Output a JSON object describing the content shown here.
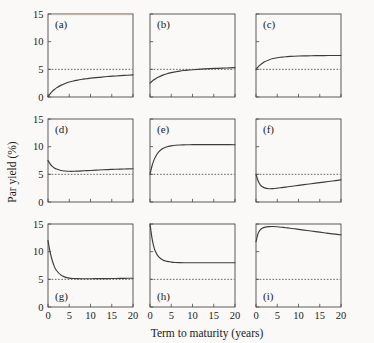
{
  "figure": {
    "background_color": "#faf9f7",
    "line_color": "#3c3c3c",
    "axis_color": "#4a4a4a",
    "x_axis_title": "Term to maturity (years)",
    "y_axis_title": "Par yield (%)",
    "x_ticks": [
      0,
      5,
      10,
      15,
      20
    ],
    "y_ticks": [
      0,
      5,
      10,
      15
    ],
    "x_tick_labels": [
      "0",
      "5",
      "10",
      "15",
      "20"
    ],
    "y_tick_labels": [
      "0",
      "5",
      "10",
      "15"
    ],
    "reference_level": 5,
    "reference_style": "dotted"
  },
  "chart_data": {
    "type": "line",
    "title": "",
    "xlabel": "Term to maturity (years)",
    "ylabel": "Par yield (%)",
    "xlim": [
      0,
      20
    ],
    "ylim": [
      0,
      15
    ],
    "grid": false,
    "legend": "none",
    "layout": "3x3 grid of panels",
    "annotations": [
      {
        "panel": "a",
        "text": "(a)",
        "position": "top-left"
      },
      {
        "panel": "b",
        "text": "(b)",
        "position": "top-left"
      },
      {
        "panel": "c",
        "text": "(c)",
        "position": "top-left"
      },
      {
        "panel": "d",
        "text": "(d)",
        "position": "top-left"
      },
      {
        "panel": "e",
        "text": "(e)",
        "position": "top-left"
      },
      {
        "panel": "f",
        "text": "(f)",
        "position": "top-left"
      },
      {
        "panel": "g",
        "text": "(g)",
        "position": "bottom-left"
      },
      {
        "panel": "h",
        "text": "(h)",
        "position": "bottom-left"
      },
      {
        "panel": "i",
        "text": "(i)",
        "position": "bottom-left"
      }
    ],
    "reference_line": {
      "type": "horizontal",
      "value": 5,
      "style": "dotted"
    },
    "x": [
      0,
      0.5,
      1,
      1.5,
      2,
      3,
      4,
      5,
      6,
      7,
      8,
      9,
      10,
      12,
      14,
      16,
      18,
      20
    ],
    "panels": [
      {
        "label": "(a)",
        "label_position": "top-left",
        "values": [
          0.05,
          0.55,
          1.0,
          1.35,
          1.65,
          2.1,
          2.45,
          2.7,
          2.9,
          3.05,
          3.2,
          3.3,
          3.4,
          3.55,
          3.7,
          3.8,
          3.9,
          4.0
        ]
      },
      {
        "label": "(b)",
        "label_position": "top-left",
        "values": [
          2.5,
          2.85,
          3.15,
          3.4,
          3.6,
          3.95,
          4.2,
          4.4,
          4.55,
          4.68,
          4.78,
          4.86,
          4.93,
          5.03,
          5.12,
          5.18,
          5.24,
          5.3
        ]
      },
      {
        "label": "(c)",
        "label_position": "top-left",
        "values": [
          5.0,
          5.45,
          5.8,
          6.1,
          6.35,
          6.7,
          6.95,
          7.1,
          7.2,
          7.28,
          7.33,
          7.37,
          7.4,
          7.44,
          7.47,
          7.49,
          7.5,
          7.5
        ]
      },
      {
        "label": "(d)",
        "label_position": "top-left",
        "values": [
          7.5,
          6.9,
          6.45,
          6.15,
          5.95,
          5.7,
          5.6,
          5.55,
          5.55,
          5.58,
          5.62,
          5.66,
          5.7,
          5.78,
          5.86,
          5.92,
          5.97,
          6.0
        ]
      },
      {
        "label": "(e)",
        "label_position": "top-left",
        "values": [
          5.0,
          6.6,
          7.7,
          8.45,
          9.0,
          9.65,
          9.98,
          10.15,
          10.25,
          10.3,
          10.33,
          10.35,
          10.36,
          10.37,
          10.37,
          10.37,
          10.36,
          10.35
        ]
      },
      {
        "label": "(f)",
        "label_position": "top-left",
        "values": [
          5.0,
          3.8,
          3.1,
          2.75,
          2.55,
          2.4,
          2.42,
          2.5,
          2.6,
          2.7,
          2.8,
          2.9,
          3.0,
          3.2,
          3.4,
          3.6,
          3.8,
          4.0
        ]
      },
      {
        "label": "(g)",
        "label_position": "bottom-left",
        "values": [
          12.0,
          9.9,
          8.4,
          7.3,
          6.6,
          5.8,
          5.4,
          5.22,
          5.15,
          5.12,
          5.11,
          5.11,
          5.11,
          5.12,
          5.14,
          5.16,
          5.18,
          5.2
        ]
      },
      {
        "label": "(h)",
        "label_position": "bottom-left",
        "values": [
          15.0,
          12.3,
          10.6,
          9.7,
          9.1,
          8.5,
          8.25,
          8.12,
          8.05,
          8.02,
          8.0,
          8.0,
          8.0,
          8.0,
          8.0,
          8.0,
          8.0,
          8.0
        ]
      },
      {
        "label": "(i)",
        "label_position": "bottom-left",
        "values": [
          11.8,
          13.3,
          13.95,
          14.25,
          14.4,
          14.52,
          14.55,
          14.5,
          14.42,
          14.33,
          14.24,
          14.14,
          14.04,
          13.83,
          13.62,
          13.42,
          13.22,
          13.05
        ]
      }
    ]
  }
}
